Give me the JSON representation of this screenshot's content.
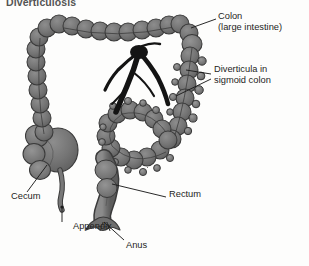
{
  "figure": {
    "title": "Diverticulosis",
    "footer": "",
    "background_color": "#fdfdfc",
    "organ_fill": "#6f6f6f",
    "organ_fill_light": "#8a8a8a",
    "organ_outline": "#3a3a3a",
    "vessel_color": "#1c1c1c",
    "leader_color": "#1d1d1d",
    "label_color": "#1d1d1d"
  },
  "labels": [
    {
      "id": "colon",
      "line1": "Colon",
      "line2": "(large intestine)",
      "x": 218,
      "y": 16
    },
    {
      "id": "diverticula",
      "line1": "Diverticula in",
      "line2": "sigmoid colon",
      "x": 214,
      "y": 69
    },
    {
      "id": "cecum",
      "line1": "Cecum",
      "line2": "",
      "x": 11,
      "y": 197
    },
    {
      "id": "appendix",
      "line1": "Appendix",
      "line2": "",
      "x": 73,
      "y": 226
    },
    {
      "id": "rectum",
      "line1": "Rectum",
      "line2": "",
      "x": 169,
      "y": 194
    },
    {
      "id": "anus",
      "line1": "Anus",
      "line2": "",
      "x": 126,
      "y": 245
    }
  ],
  "anatomy": {
    "ascending_colon": "ascending-colon",
    "transverse_colon": "transverse-colon",
    "descending_colon": "descending-colon",
    "sigmoid_colon": "sigmoid-colon",
    "cecum": "cecum",
    "appendix": "appendix",
    "rectum": "rectum",
    "anus": "anus",
    "mesenteric_vessels": "mesenteric-vessels",
    "diverticula": "diverticula-pouches"
  }
}
